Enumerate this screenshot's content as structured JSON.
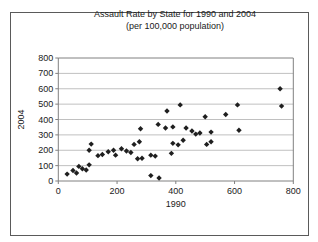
{
  "title": {
    "line1": "Assault Rate by State for 1990 and 2004",
    "line2": "(per 100,000 population)"
  },
  "chart_data": {
    "type": "scatter",
    "title": "Assault Rate by State for 1990 and 2004 (per 100,000 population)",
    "xlabel": "1990",
    "ylabel": "2004",
    "xlim": [
      0,
      800
    ],
    "ylim": [
      0,
      800
    ],
    "x_ticks": [
      0,
      200,
      400,
      600,
      800
    ],
    "y_ticks": [
      0,
      100,
      200,
      300,
      400,
      500,
      600,
      700,
      800
    ],
    "grid": "horizontal-only",
    "legend": "none",
    "marker": "diamond",
    "points": [
      [
        30,
        45
      ],
      [
        50,
        68
      ],
      [
        62,
        52
      ],
      [
        70,
        95
      ],
      [
        82,
        80
      ],
      [
        95,
        72
      ],
      [
        105,
        105
      ],
      [
        105,
        200
      ],
      [
        112,
        240
      ],
      [
        135,
        165
      ],
      [
        150,
        172
      ],
      [
        170,
        190
      ],
      [
        188,
        200
      ],
      [
        195,
        168
      ],
      [
        215,
        210
      ],
      [
        232,
        195
      ],
      [
        247,
        185
      ],
      [
        258,
        238
      ],
      [
        270,
        145
      ],
      [
        276,
        255
      ],
      [
        280,
        340
      ],
      [
        285,
        148
      ],
      [
        315,
        35
      ],
      [
        315,
        168
      ],
      [
        330,
        162
      ],
      [
        340,
        368
      ],
      [
        343,
        20
      ],
      [
        365,
        345
      ],
      [
        370,
        455
      ],
      [
        385,
        180
      ],
      [
        390,
        245
      ],
      [
        390,
        352
      ],
      [
        408,
        235
      ],
      [
        415,
        495
      ],
      [
        425,
        265
      ],
      [
        435,
        345
      ],
      [
        455,
        325
      ],
      [
        468,
        305
      ],
      [
        482,
        312
      ],
      [
        500,
        418
      ],
      [
        505,
        238
      ],
      [
        520,
        255
      ],
      [
        520,
        318
      ],
      [
        570,
        433
      ],
      [
        610,
        495
      ],
      [
        615,
        330
      ],
      [
        755,
        600
      ],
      [
        760,
        487
      ]
    ]
  },
  "colors": {
    "background": "#ffffff",
    "frame_border": "#5a5a5a",
    "plot_border": "#808080",
    "gridline": "#c0c0c0",
    "axis": "#808080",
    "text": "#1a1a1a",
    "marker": "#1f1f1f"
  }
}
